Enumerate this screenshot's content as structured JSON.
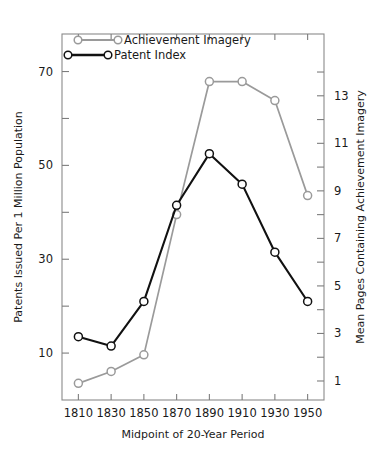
{
  "chart_data": {
    "type": "line",
    "title": "",
    "xlabel": "Midpoint of 20-Year Period",
    "ylabel": "Patents Issued Per 1 Million Population",
    "y2label": "Mean Pages Containing Achievement Imagery",
    "x": [
      1810,
      1830,
      1850,
      1870,
      1890,
      1910,
      1930,
      1950
    ],
    "xtick_labels": [
      "1810",
      "1830",
      "1850",
      "1870",
      "1890",
      "1910",
      "1930",
      "1950"
    ],
    "xlim": [
      1800,
      1960
    ],
    "ylim": [
      0,
      78
    ],
    "ytick_labels": [
      "70",
      "50",
      "30",
      "10"
    ],
    "ytick_values": [
      70,
      50,
      30,
      10
    ],
    "yminor_values": [
      60,
      40,
      20
    ],
    "y2lim": [
      0.2,
      15.6
    ],
    "y2tick_labels": [
      "13",
      "11",
      "9",
      "7",
      "5",
      "3",
      "1"
    ],
    "y2tick_values": [
      13,
      11,
      9,
      7,
      5,
      3,
      1
    ],
    "y2minor_values": [
      14,
      12,
      10,
      8,
      6,
      4,
      2
    ],
    "grid": false,
    "legend_position": "top-left",
    "series": [
      {
        "name": "Achievement Imagery",
        "axis": "right",
        "color": "#9a9a9a",
        "marker": "open-circle",
        "values": [
          0.9,
          1.4,
          2.1,
          8.0,
          13.6,
          13.6,
          12.8,
          8.8
        ]
      },
      {
        "name": "Patent Index",
        "axis": "left",
        "color": "#111111",
        "marker": "open-circle",
        "values": [
          13.5,
          11.5,
          21.0,
          41.5,
          52.5,
          46.0,
          31.5,
          21.0
        ]
      }
    ]
  },
  "legend": {
    "entries": [
      {
        "label": "Achievement Imagery"
      },
      {
        "label": "Patent Index"
      }
    ]
  }
}
